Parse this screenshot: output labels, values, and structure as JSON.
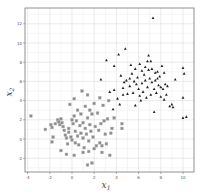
{
  "chart_data": {
    "type": "scatter",
    "title": "",
    "xlabel": "X1",
    "ylabel": "X2",
    "xlim": [
      -4.3,
      11.1
    ],
    "ylim": [
      -3.5,
      13.6
    ],
    "x_ticks": [
      -4,
      -2,
      0,
      2,
      4,
      6,
      8,
      10
    ],
    "y_ticks": [
      -2,
      0,
      2,
      4,
      6,
      8,
      10,
      12
    ],
    "grid": true,
    "legend": null,
    "series": [
      {
        "name": "class 0",
        "marker": "square",
        "color": "#8c8c8c",
        "points": [
          [
            -3.7,
            2.4
          ],
          [
            -2.4,
            1.0
          ],
          [
            -1.9,
            1.5
          ],
          [
            -1.8,
            1.2
          ],
          [
            -1.7,
            0.2
          ],
          [
            -1.8,
            -0.3
          ],
          [
            -1.5,
            1.6
          ],
          [
            -1.3,
            2.0
          ],
          [
            -1.2,
            1.8
          ],
          [
            -1.1,
            1.5
          ],
          [
            -1.0,
            2.1
          ],
          [
            -0.9,
            1.7
          ],
          [
            -0.8,
            1.3
          ],
          [
            -0.7,
            0.9
          ],
          [
            -0.6,
            0.4
          ],
          [
            -0.5,
            0.1
          ],
          [
            -0.4,
            -0.5
          ],
          [
            -0.3,
            1.1
          ],
          [
            -0.2,
            3.6
          ],
          [
            -0.1,
            0.2
          ],
          [
            0.0,
            2.0
          ],
          [
            0.0,
            -0.1
          ],
          [
            0.1,
            1.6
          ],
          [
            0.2,
            4.2
          ],
          [
            0.2,
            2.4
          ],
          [
            0.3,
            0.8
          ],
          [
            0.3,
            -0.4
          ],
          [
            0.4,
            1.9
          ],
          [
            0.5,
            3.0
          ],
          [
            0.5,
            0.3
          ],
          [
            0.6,
            -0.6
          ],
          [
            0.7,
            1.4
          ],
          [
            0.8,
            2.6
          ],
          [
            0.8,
            0.6
          ],
          [
            0.9,
            5.0
          ],
          [
            1.0,
            1.7
          ],
          [
            1.0,
            0.1
          ],
          [
            1.1,
            -0.9
          ],
          [
            1.2,
            3.4
          ],
          [
            1.2,
            1.1
          ],
          [
            1.3,
            0.5
          ],
          [
            1.4,
            4.6
          ],
          [
            1.4,
            2.2
          ],
          [
            1.5,
            -0.2
          ],
          [
            1.5,
            -1.3
          ],
          [
            1.6,
            3.0
          ],
          [
            1.6,
            1.5
          ],
          [
            1.7,
            0.8
          ],
          [
            1.8,
            -2.5
          ],
          [
            1.8,
            2.6
          ],
          [
            1.9,
            0.2
          ],
          [
            2.0,
            -1.0
          ],
          [
            2.0,
            3.7
          ],
          [
            2.1,
            1.3
          ],
          [
            2.2,
            -0.7
          ],
          [
            2.3,
            2.7
          ],
          [
            2.4,
            0.9
          ],
          [
            2.5,
            4.3
          ],
          [
            2.5,
            -0.4
          ],
          [
            2.6,
            1.6
          ],
          [
            2.7,
            -1.4
          ],
          [
            2.8,
            3.5
          ],
          [
            2.9,
            1.9
          ],
          [
            3.0,
            0.5
          ],
          [
            3.1,
            -0.5
          ],
          [
            3.2,
            2.1
          ],
          [
            3.3,
            4.0
          ],
          [
            3.4,
            -1.7
          ],
          [
            3.5,
            0.6
          ],
          [
            3.6,
            1.1
          ],
          [
            3.8,
            2.2
          ],
          [
            4.5,
            1.6
          ],
          [
            4.5,
            1.1
          ],
          [
            -1.0,
            -1.2
          ],
          [
            -0.5,
            -1.6
          ],
          [
            0.2,
            -1.7
          ],
          [
            1.0,
            -1.4
          ],
          [
            1.4,
            -2.7
          ],
          [
            2.7,
            -0.7
          ],
          [
            -0.3,
            0.7
          ]
        ]
      },
      {
        "name": "class 1",
        "marker": "triangle",
        "color": "#222222",
        "points": [
          [
            7.3,
            12.6
          ],
          [
            4.8,
            9.4
          ],
          [
            4.2,
            8.8
          ],
          [
            3.1,
            8.2
          ],
          [
            6.9,
            8.7
          ],
          [
            7.1,
            8.1
          ],
          [
            6.8,
            8.1
          ],
          [
            2.6,
            6.2
          ],
          [
            3.8,
            7.6
          ],
          [
            5.3,
            7.7
          ],
          [
            5.7,
            7.3
          ],
          [
            6.1,
            7.8
          ],
          [
            6.3,
            7.1
          ],
          [
            6.5,
            6.7
          ],
          [
            6.9,
            7.2
          ],
          [
            7.2,
            7.3
          ],
          [
            7.5,
            6.9
          ],
          [
            7.7,
            7.0
          ],
          [
            7.9,
            6.5
          ],
          [
            8.1,
            7.6
          ],
          [
            8.3,
            6.9
          ],
          [
            8.4,
            5.7
          ],
          [
            8.6,
            5.5
          ],
          [
            9.3,
            6.2
          ],
          [
            10.0,
            7.4
          ],
          [
            10.1,
            6.8
          ],
          [
            3.4,
            4.9
          ],
          [
            3.8,
            5.1
          ],
          [
            4.1,
            4.2
          ],
          [
            4.4,
            6.6
          ],
          [
            4.6,
            5.3
          ],
          [
            4.7,
            5.9
          ],
          [
            4.9,
            6.1
          ],
          [
            5.0,
            4.7
          ],
          [
            5.2,
            5.5
          ],
          [
            5.4,
            6.8
          ],
          [
            5.5,
            4.8
          ],
          [
            5.6,
            6.0
          ],
          [
            5.8,
            5.7
          ],
          [
            5.9,
            6.4
          ],
          [
            6.0,
            5.2
          ],
          [
            6.1,
            4.5
          ],
          [
            6.2,
            4.0
          ],
          [
            6.3,
            5.8
          ],
          [
            6.4,
            4.9
          ],
          [
            6.6,
            6.1
          ],
          [
            6.7,
            4.3
          ],
          [
            6.8,
            5.4
          ],
          [
            7.0,
            6.3
          ],
          [
            7.1,
            4.6
          ],
          [
            7.2,
            5.9
          ],
          [
            7.4,
            5.2
          ],
          [
            7.5,
            6.1
          ],
          [
            7.6,
            4.8
          ],
          [
            7.8,
            5.6
          ],
          [
            8.0,
            4.4
          ],
          [
            8.2,
            5.2
          ],
          [
            8.3,
            4.1
          ],
          [
            8.5,
            4.6
          ],
          [
            8.8,
            3.4
          ],
          [
            9.0,
            3.6
          ],
          [
            9.1,
            3.3
          ],
          [
            10.0,
            4.3
          ],
          [
            10.0,
            2.2
          ],
          [
            10.3,
            2.3
          ],
          [
            7.4,
            2.8
          ],
          [
            5.7,
            3.5
          ],
          [
            4.3,
            3.6
          ],
          [
            3.7,
            3.1
          ],
          [
            4.6,
            4.6
          ],
          [
            5.2,
            6.3
          ],
          [
            6.6,
            7.5
          ],
          [
            7.7,
            6.3
          ],
          [
            8.0,
            5.4
          ]
        ]
      }
    ]
  }
}
